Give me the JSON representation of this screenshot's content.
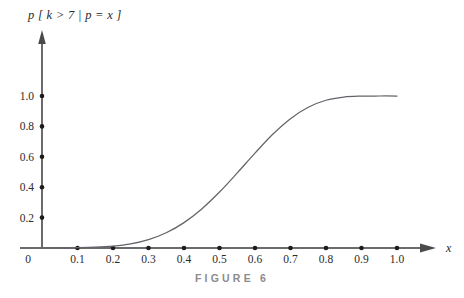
{
  "figure": {
    "caption": "FIGURE 6",
    "y_axis_expression": "p [ k > 7 | p = x ]",
    "x_axis_name": "x",
    "origin_label": "0"
  },
  "chart_data": {
    "type": "line",
    "title": "p [ k > 7 | p = x ]",
    "xlabel": "x",
    "ylabel": "p [ k > 7 | p = x ]",
    "xlim": [
      0.0,
      1.0
    ],
    "ylim": [
      0.0,
      1.08
    ],
    "grid": false,
    "legend": null,
    "x_ticks": [
      0.1,
      0.2,
      0.3,
      0.4,
      0.5,
      0.6,
      0.7,
      0.8,
      0.9,
      1.0
    ],
    "x_tick_labels": [
      "0.1",
      "0.2",
      "0.3",
      "0.4",
      "0.5",
      "0.6",
      "0.7",
      "0.8",
      "0.9",
      "1.0"
    ],
    "y_ticks": [
      0.2,
      0.4,
      0.6,
      0.8,
      1.0
    ],
    "y_tick_labels": [
      "0.2",
      "0.4",
      "0.6",
      "0.8",
      "1.0"
    ],
    "series": [
      {
        "name": "p[k>7 | p=x]",
        "color": "#63636a",
        "x": [
          0.0,
          0.05,
          0.1,
          0.15,
          0.2,
          0.25,
          0.3,
          0.35,
          0.4,
          0.45,
          0.5,
          0.55,
          0.6,
          0.65,
          0.7,
          0.75,
          0.8,
          0.85,
          0.9,
          0.95,
          1.0
        ],
        "y": [
          0.0,
          0.001,
          0.002,
          0.005,
          0.012,
          0.027,
          0.055,
          0.1,
          0.167,
          0.257,
          0.368,
          0.494,
          0.624,
          0.748,
          0.851,
          0.926,
          0.972,
          0.993,
          0.999,
          1.0,
          1.0
        ]
      }
    ]
  }
}
